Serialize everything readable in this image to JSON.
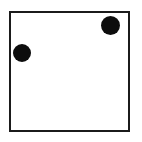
{
  "figure": {
    "type": "square-with-dots",
    "background_color": "#ffffff",
    "frame": {
      "label": "square-outline",
      "stroke_color": "#1b1b1b",
      "stroke_width_px": 2,
      "fill_color": "#ffffff",
      "x_px": 9,
      "y_px": 11,
      "width_px": 121,
      "height_px": 121
    },
    "dots": [
      {
        "label": "upper-right-dot",
        "fill_color": "#0d0d0d",
        "center_x_px": 110,
        "center_y_px": 25,
        "diameter_px": 19
      },
      {
        "label": "left-dot",
        "fill_color": "#0d0d0d",
        "center_x_px": 22,
        "center_y_px": 53,
        "diameter_px": 18
      }
    ],
    "dot_count": 2
  }
}
